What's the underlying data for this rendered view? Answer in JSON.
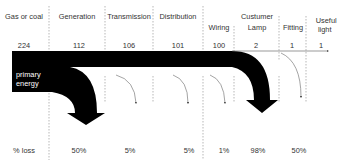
{
  "stages": [
    {
      "label": "Gas or coal",
      "value": "224",
      "loss": "% loss"
    },
    {
      "label": "Generation",
      "value": "112",
      "loss": "50%"
    },
    {
      "label": "Transmission",
      "value": "106",
      "loss": "5%"
    },
    {
      "label": "Distribution",
      "value": "101",
      "loss": "5%"
    },
    {
      "label": "Wiring",
      "value": "100",
      "loss": "1%"
    },
    {
      "label": "Custumer Lamp",
      "label_line1": "Custumer",
      "label_line2": "Lamp",
      "value": "2",
      "loss": "98%"
    },
    {
      "label": "Fitting",
      "value": "1",
      "loss": "50%"
    },
    {
      "label": "Useful light",
      "label_line1": "Useful",
      "label_line2": "light",
      "value": "1",
      "loss": ""
    }
  ],
  "source_label": {
    "line1": "primary",
    "line2": "energy"
  },
  "colors": {
    "flow": "#000000",
    "text": "#333333",
    "dash": "#888888",
    "background": "#ffffff"
  }
}
